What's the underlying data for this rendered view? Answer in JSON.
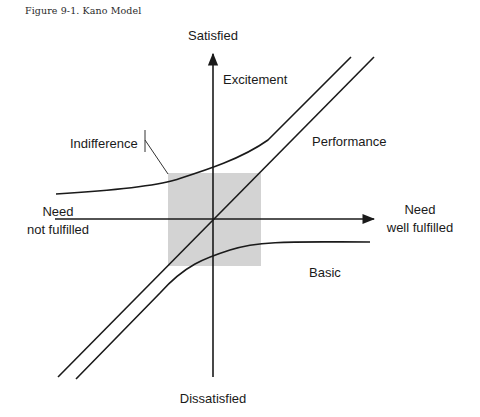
{
  "figure": {
    "caption": "Figure 9-1.  Kano Model"
  },
  "axes": {
    "y_top_label": "Satisfied",
    "y_bottom_label": "Dissatisfied",
    "x_left_label_line1": "Need",
    "x_left_label_line2": "not fulfilled",
    "x_right_label_line1": "Need",
    "x_right_label_line2": "well fulfilled"
  },
  "curves": {
    "excitement": "Excitement",
    "performance": "Performance",
    "indifference": "Indifference",
    "basic": "Basic"
  },
  "colors": {
    "line": "#1a1a1a",
    "indifference_zone": "#d3d3d3"
  }
}
